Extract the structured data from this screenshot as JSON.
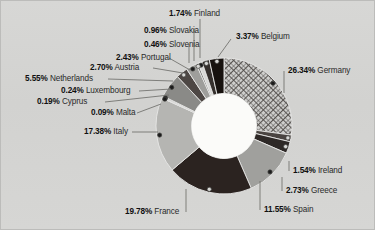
{
  "chart_data": {
    "type": "pie",
    "variant": "donut",
    "title": "",
    "subtitle": "",
    "xlabel": "",
    "ylabel": "",
    "legend_position": "none",
    "grid": false,
    "units": "percent",
    "total": 100.0,
    "categories": [
      "Germany",
      "Ireland",
      "Greece",
      "Spain",
      "France",
      "Italy",
      "Malta",
      "Cyprus",
      "Luxembourg",
      "Netherlands",
      "Austria",
      "Portugal",
      "Slovenia",
      "Slovakia",
      "Finland",
      "Belgium"
    ],
    "values": [
      26.34,
      1.54,
      2.73,
      11.55,
      19.78,
      17.38,
      0.09,
      0.19,
      0.24,
      5.55,
      2.7,
      2.43,
      0.46,
      0.96,
      1.74,
      3.37
    ],
    "slices": [
      {
        "name": "Germany",
        "value": 26.34,
        "label": "26.34%",
        "fill": "crosshatch",
        "color": "#c9c9c7"
      },
      {
        "name": "Ireland",
        "value": 1.54,
        "label": "1.54%",
        "fill": "solid",
        "color": "#4a4441"
      },
      {
        "name": "Greece",
        "value": 2.73,
        "label": "2.73%",
        "fill": "solid",
        "color": "#2e2927"
      },
      {
        "name": "Spain",
        "value": 11.55,
        "label": "11.55%",
        "fill": "solid",
        "color": "#a0a09d"
      },
      {
        "name": "France",
        "value": 19.78,
        "label": "19.78%",
        "fill": "solid",
        "color": "#2b2320"
      },
      {
        "name": "Italy",
        "value": 17.38,
        "label": "17.38%",
        "fill": "solid",
        "color": "#b5b5b2"
      },
      {
        "name": "Malta",
        "value": 0.09,
        "label": "0.09%",
        "fill": "solid",
        "color": "#9d9d9a"
      },
      {
        "name": "Cyprus",
        "value": 0.19,
        "label": "0.19%",
        "fill": "solid",
        "color": "#8f8f8c"
      },
      {
        "name": "Luxembourg",
        "value": 0.24,
        "label": "0.24%",
        "fill": "solid",
        "color": "#7d7d7a"
      },
      {
        "name": "Netherlands",
        "value": 5.55,
        "label": "5.55%",
        "fill": "solid",
        "color": "#8a8a87"
      },
      {
        "name": "Austria",
        "value": 2.7,
        "label": "2.70%",
        "fill": "solid",
        "color": "#4d4744"
      },
      {
        "name": "Portugal",
        "value": 2.43,
        "label": "2.43%",
        "fill": "solid",
        "color": "#9e9e9b"
      },
      {
        "name": "Slovenia",
        "value": 0.46,
        "label": "0.46%",
        "fill": "solid",
        "color": "#6e6e6b"
      },
      {
        "name": "Slovakia",
        "value": 0.96,
        "label": "0.96%",
        "fill": "solid",
        "color": "#d8d8d6"
      },
      {
        "name": "Finland",
        "value": 1.74,
        "label": "1.74%",
        "fill": "solid",
        "color": "#35302d"
      },
      {
        "name": "Belgium",
        "value": 3.37,
        "label": "3.37%",
        "fill": "solid",
        "color": "#17120f"
      }
    ]
  },
  "labels": {
    "germany": {
      "pct": "26.34%",
      "name": "Germany"
    },
    "ireland": {
      "pct": "1.54%",
      "name": "Ireland"
    },
    "greece": {
      "pct": "2.73%",
      "name": "Greece"
    },
    "spain": {
      "pct": "11.55%",
      "name": "Spain"
    },
    "france": {
      "pct": "19.78%",
      "name": "France"
    },
    "italy": {
      "pct": "17.38%",
      "name": "Italy"
    },
    "malta": {
      "pct": "0.09%",
      "name": "Malta"
    },
    "cyprus": {
      "pct": "0.19%",
      "name": "Cyprus"
    },
    "luxembourg": {
      "pct": "0.24%",
      "name": "Luxembourg"
    },
    "netherlands": {
      "pct": "5.55%",
      "name": "Netherlands"
    },
    "austria": {
      "pct": "2.70%",
      "name": "Austria"
    },
    "portugal": {
      "pct": "2.43%",
      "name": "Portugal"
    },
    "slovenia": {
      "pct": "0.46%",
      "name": "Slovenia"
    },
    "slovakia": {
      "pct": "0.96%",
      "name": "Slovakia"
    },
    "finland": {
      "pct": "1.74%",
      "name": "Finland"
    },
    "belgium": {
      "pct": "3.37%",
      "name": "Belgium"
    }
  },
  "style": {
    "background": "#d5d5d3",
    "border": "#bcbcba",
    "hole": "#fbfbf9",
    "leader": "#6f6f6c",
    "text": "#1d1d1d"
  }
}
